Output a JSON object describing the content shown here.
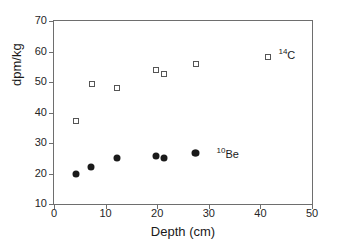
{
  "chart_data": {
    "type": "scatter",
    "title": "",
    "xlabel": "Depth (cm)",
    "ylabel": "dpm/kg",
    "xlim": [
      0,
      50
    ],
    "ylim": [
      10,
      70
    ],
    "xticks": [
      0,
      10,
      20,
      30,
      40,
      50
    ],
    "yticks": [
      10,
      20,
      30,
      40,
      50,
      60,
      70
    ],
    "grid": false,
    "legend_position": "in-plot-annotation",
    "series": [
      {
        "name": "14C",
        "label_text": "C",
        "label_sup": "14",
        "marker": "open-square",
        "color": "#555555",
        "label_x": 43.5,
        "label_y": 59.0,
        "points": [
          {
            "x": 4.2,
            "y": 37.3
          },
          {
            "x": 7.3,
            "y": 49.2
          },
          {
            "x": 12.3,
            "y": 48.0
          },
          {
            "x": 19.7,
            "y": 53.9
          },
          {
            "x": 21.3,
            "y": 52.6
          },
          {
            "x": 27.5,
            "y": 55.9
          },
          {
            "x": 41.5,
            "y": 58.3
          }
        ]
      },
      {
        "name": "10Be",
        "label_text": "Be",
        "label_sup": "10",
        "marker": "filled-circle",
        "color": "#1a1a1a",
        "label_x": 31.5,
        "label_y": 26.5,
        "points": [
          {
            "x": 4.2,
            "y": 20.0
          },
          {
            "x": 7.2,
            "y": 22.0
          },
          {
            "x": 12.2,
            "y": 25.0
          },
          {
            "x": 19.8,
            "y": 25.6
          },
          {
            "x": 21.4,
            "y": 25.2
          },
          {
            "x": 27.4,
            "y": 26.6
          }
        ]
      }
    ],
    "legend_markers": [
      {
        "series": "10Be",
        "x": 27.6,
        "y": 26.6
      }
    ]
  }
}
